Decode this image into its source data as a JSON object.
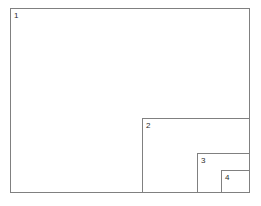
{
  "figure": {
    "background_color": "#ffffff",
    "stroke_color": "#808080",
    "label_color": "#2b2b2b",
    "stroke_width_px": 1,
    "width_px": 261,
    "height_px": 206
  },
  "diagram_data": {
    "type": "nested-rectangles",
    "description": "Four nested axis-aligned rectangles sharing a common bottom-right corner, decreasing in size, each labeled with its index at its top-left interior corner.",
    "shared_corner": {
      "x": 250,
      "y": 193
    },
    "rectangles": [
      {
        "label": "1",
        "x": 10,
        "y": 8,
        "width": 240,
        "height": 185,
        "label_x": 14,
        "label_y": 12
      },
      {
        "label": "2",
        "x": 142,
        "y": 118,
        "width": 108,
        "height": 75,
        "label_x": 146,
        "label_y": 122
      },
      {
        "label": "3",
        "x": 197,
        "y": 153,
        "width": 53,
        "height": 40,
        "label_x": 201,
        "label_y": 157
      },
      {
        "label": "4",
        "x": 221,
        "y": 170,
        "width": 29,
        "height": 23,
        "label_x": 225,
        "label_y": 174
      }
    ]
  }
}
